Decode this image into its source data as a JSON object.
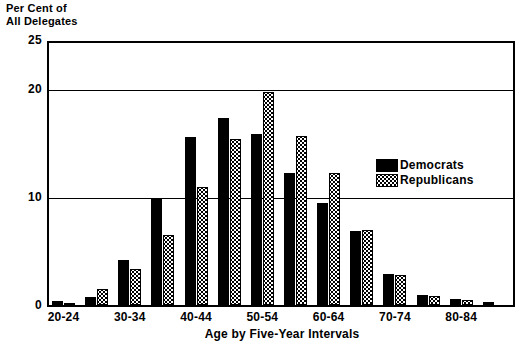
{
  "chart_data": {
    "type": "bar",
    "title": "",
    "ylabel": "Per Cent of\nAll Delegates",
    "ylabel_line1": "Per Cent of",
    "ylabel_line2": "All Delegates",
    "xlabel": "Age by Five-Year Intervals",
    "ylim": [
      0,
      25
    ],
    "yticks": [
      0,
      10,
      20,
      25
    ],
    "ytick_labels": [
      "0",
      "10",
      "20",
      "25"
    ],
    "gridlines": [
      10,
      20,
      25
    ],
    "grid": true,
    "legend_position": "inside-right",
    "categories": [
      "20-24",
      "25-29",
      "30-34",
      "35-39",
      "40-44",
      "45-49",
      "50-54",
      "55-59",
      "60-64",
      "65-69",
      "70-74",
      "75-79",
      "80-84",
      "85-89"
    ],
    "xtick_labels": [
      "20-24",
      "30-34",
      "40-44",
      "50-54",
      "60-64",
      "70-74",
      "80-84"
    ],
    "series": [
      {
        "name": "Democrats",
        "color": "#000000",
        "pattern": "solid",
        "values": [
          0.4,
          0.8,
          4.3,
          10.2,
          16.0,
          17.8,
          16.3,
          12.6,
          9.7,
          7.1,
          3.0,
          1.0,
          0.6,
          0.3
        ]
      },
      {
        "name": "Republicans",
        "color": "#000000",
        "pattern": "stippled",
        "values": [
          0.2,
          1.5,
          3.4,
          6.7,
          11.3,
          15.8,
          20.3,
          16.1,
          12.6,
          7.2,
          2.9,
          0.9,
          0.5,
          0.0
        ]
      }
    ]
  },
  "legend": {
    "items": [
      {
        "label": "Democrats",
        "swatch": "solid-black-swatch"
      },
      {
        "label": "Republicans",
        "swatch": "stippled-swatch"
      }
    ]
  }
}
